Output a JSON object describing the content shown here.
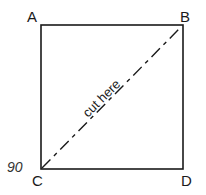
{
  "diagram": {
    "vertices": [
      {
        "label": "A",
        "position": "top-left"
      },
      {
        "label": "B",
        "position": "top-right"
      },
      {
        "label": "C",
        "position": "bottom-left"
      },
      {
        "label": "D",
        "position": "bottom-right"
      }
    ],
    "diagonal_label": "cut here",
    "diagonal": {
      "from": "C",
      "to": "B",
      "style": "dashed"
    },
    "page_number": "90"
  }
}
